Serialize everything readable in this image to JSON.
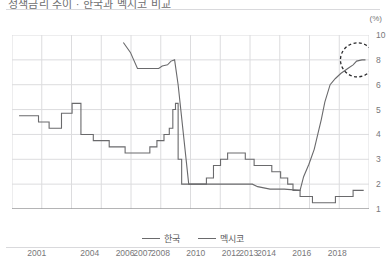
{
  "header": {
    "title": "정책금리 추이 · 한국과 멕시코 비교",
    "unit_label": "(%)"
  },
  "legend": {
    "position": "bottom-center",
    "items": [
      {
        "label": "한국",
        "color": "#6a6a6c"
      },
      {
        "label": "멕시코",
        "color": "#6a6a6c"
      }
    ]
  },
  "annotation": {
    "shape": "dashed-circle",
    "target_label": "8",
    "note": "멕시코 최근 금리 약 8% 강조"
  },
  "chart_data": {
    "type": "line",
    "title": "정책금리 추이 · 한국과 멕시코 비교",
    "xlabel": "",
    "ylabel": "",
    "unit": "%",
    "grid": true,
    "legend_position": "bottom-center",
    "x_tick_labels": [
      "2001",
      "2004",
      "2006",
      "2007",
      "2008",
      "2010",
      "2012",
      "2013",
      "2014",
      "2016",
      "2018"
    ],
    "y_tick_labels": [
      "10",
      "8",
      "6",
      "5",
      "4",
      "3",
      "2",
      "1"
    ],
    "y_tick_values": [
      10,
      8,
      6,
      5,
      4,
      3,
      2,
      1
    ],
    "y_axis_note": "비균등(단절) 축 간격: 10-8-6-5-4-3-2-1",
    "ylim": [
      1,
      10
    ],
    "series": [
      {
        "name": "한국",
        "color": "#6a6a6c",
        "style": "step",
        "points": [
          [
            2000.0,
            4.75
          ],
          [
            2001.0,
            4.75
          ],
          [
            2001.1,
            4.5
          ],
          [
            2001.6,
            4.5
          ],
          [
            2001.7,
            4.25
          ],
          [
            2002.2,
            4.25
          ],
          [
            2002.4,
            4.85
          ],
          [
            2003.0,
            5.25
          ],
          [
            2003.3,
            5.25
          ],
          [
            2003.5,
            4.0
          ],
          [
            2003.9,
            4.0
          ],
          [
            2004.2,
            3.75
          ],
          [
            2004.6,
            3.75
          ],
          [
            2005.1,
            3.5
          ],
          [
            2005.6,
            3.5
          ],
          [
            2006.0,
            3.25
          ],
          [
            2007.0,
            3.25
          ],
          [
            2007.4,
            3.5
          ],
          [
            2007.8,
            3.75
          ],
          [
            2008.2,
            4.0
          ],
          [
            2008.5,
            4.25
          ],
          [
            2008.7,
            5.0
          ],
          [
            2008.85,
            5.25
          ],
          [
            2009.0,
            3.0
          ],
          [
            2009.2,
            2.0
          ],
          [
            2010.3,
            2.0
          ],
          [
            2010.6,
            2.25
          ],
          [
            2011.0,
            2.75
          ],
          [
            2011.4,
            3.0
          ],
          [
            2011.8,
            3.25
          ],
          [
            2012.4,
            3.25
          ],
          [
            2012.8,
            3.0
          ],
          [
            2013.3,
            2.75
          ],
          [
            2014.3,
            2.5
          ],
          [
            2014.8,
            2.25
          ],
          [
            2015.2,
            2.0
          ],
          [
            2015.5,
            1.75
          ],
          [
            2015.9,
            1.5
          ],
          [
            2016.6,
            1.25
          ],
          [
            2017.9,
            1.5
          ],
          [
            2018.9,
            1.75
          ],
          [
            2019.5,
            1.75
          ]
        ]
      },
      {
        "name": "멕시코",
        "color": "#6a6a6c",
        "style": "line",
        "points": [
          [
            2005.9,
            9.4
          ],
          [
            2006.3,
            8.6
          ],
          [
            2006.7,
            7.3
          ],
          [
            2007.2,
            7.3
          ],
          [
            2007.9,
            7.3
          ],
          [
            2008.1,
            7.5
          ],
          [
            2008.4,
            7.6
          ],
          [
            2008.6,
            7.9
          ],
          [
            2008.8,
            8.0
          ],
          [
            2009.0,
            6.0
          ],
          [
            2009.3,
            4.0
          ],
          [
            2009.6,
            2.0
          ],
          [
            2013.2,
            2.0
          ],
          [
            2013.5,
            1.9
          ],
          [
            2014.2,
            1.8
          ],
          [
            2015.0,
            1.8
          ],
          [
            2015.9,
            1.75
          ],
          [
            2016.1,
            2.3
          ],
          [
            2016.4,
            2.8
          ],
          [
            2016.7,
            3.4
          ],
          [
            2016.9,
            4.0
          ],
          [
            2017.1,
            4.6
          ],
          [
            2017.3,
            5.3
          ],
          [
            2017.6,
            6.0
          ],
          [
            2017.9,
            6.5
          ],
          [
            2018.2,
            6.9
          ],
          [
            2018.6,
            7.3
          ],
          [
            2018.9,
            7.6
          ],
          [
            2019.1,
            7.9
          ],
          [
            2019.4,
            8.0
          ],
          [
            2019.6,
            8.0
          ]
        ]
      }
    ]
  },
  "axis_geometry": {
    "x_min_year": 1999.6,
    "x_max_year": 2019.8,
    "x_tick_years": [
      2001,
      2004,
      2006,
      2007,
      2008,
      2010,
      2012,
      2013,
      2014,
      2016,
      2018
    ],
    "gridline_count_vertical": 13
  }
}
